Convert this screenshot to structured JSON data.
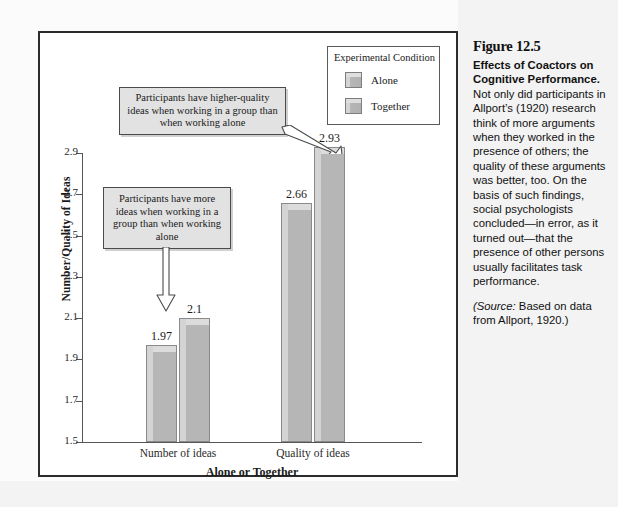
{
  "figure": {
    "number": "Figure 12.5",
    "heading": "Effects of Coactors on Cognitive Performance.",
    "body": " Not only did participants in Allport’s (1920) research think of more arguments when they worked in the presence of others; the quality of these arguments was better, too. On the basis of such findings, social psychologists concluded—in error, as it turned out—that the presence of other persons usually facilitates task performance.",
    "source_prefix": "(Source:",
    "source_text": " Based on data from Allport, 1920.)"
  },
  "legend": {
    "title": "Experimental Condition",
    "items": [
      {
        "label": "Alone",
        "color": "#b6b6b6"
      },
      {
        "label": "Together",
        "color": "#b6b6b6"
      }
    ]
  },
  "callouts": [
    {
      "id": "upper",
      "text": "Participants have higher-quality ideas when working in a group than when working alone"
    },
    {
      "id": "lower",
      "text": "Participants have more ideas when working in a group than when working alone"
    }
  ],
  "chart_data": {
    "type": "bar",
    "title": "",
    "xlabel": "Alone or Together",
    "ylabel": "Number/Quality of Ideas",
    "categories": [
      "Number of ideas",
      "Quality of ideas"
    ],
    "series": [
      {
        "name": "Alone",
        "values": [
          1.97,
          2.66
        ]
      },
      {
        "name": "Together",
        "values": [
          2.1,
          2.93
        ]
      }
    ],
    "ylim": [
      1.5,
      2.9
    ],
    "yticks": [
      "1.5",
      "1.7",
      "1.9",
      "2.1",
      "2.3",
      "2.5",
      "2.7",
      "2.9"
    ],
    "ytick_values": [
      1.5,
      1.7,
      1.9,
      2.1,
      2.3,
      2.5,
      2.7,
      2.9
    ],
    "data_labels": [
      "1.97",
      "2.1",
      "2.66",
      "2.93"
    ],
    "grid": false,
    "legend_position": "top-right"
  }
}
